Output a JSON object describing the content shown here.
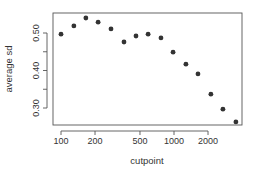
{
  "chart_data": {
    "type": "scatter",
    "title": "",
    "xlabel": "cutpoint",
    "ylabel": "average sd",
    "x_scale": "log",
    "x_ticks": [
      100,
      200,
      500,
      1000,
      2000
    ],
    "x_tick_labels": [
      "100",
      "200",
      "500",
      "1000",
      "2000"
    ],
    "y_ticks": [
      0.3,
      0.35,
      0.4,
      0.45,
      0.5
    ],
    "y_tick_labels": [
      "0.30",
      "",
      "0.40",
      "",
      "0.50"
    ],
    "xlim": [
      90,
      3700
    ],
    "ylim": [
      0.26,
      0.545
    ],
    "grid": false,
    "legend": null,
    "x": [
      100,
      130,
      166,
      213,
      277,
      361,
      461,
      590,
      767,
      981,
      1275,
      1630,
      2120,
      2710,
      3530
    ],
    "y": [
      0.497,
      0.519,
      0.54,
      0.529,
      0.511,
      0.476,
      0.492,
      0.497,
      0.487,
      0.449,
      0.417,
      0.391,
      0.337,
      0.297,
      0.263
    ],
    "point_color": "#333333"
  }
}
